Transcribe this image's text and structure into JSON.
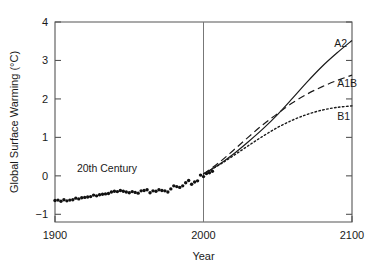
{
  "chart_data": {
    "type": "line",
    "title": "",
    "xlabel": "Year",
    "ylabel": "Global Surface Warming (°C)",
    "xlim": [
      1900,
      2100
    ],
    "ylim": [
      -1.2,
      4
    ],
    "xticks": [
      1900,
      2000,
      2100
    ],
    "xticklabels": [
      "1900",
      "2000",
      "2100"
    ],
    "yticks": [
      -1,
      0,
      1,
      2,
      3,
      4
    ],
    "yticklabels": [
      "−1",
      "0",
      "1",
      "2",
      "3",
      "4"
    ],
    "grid": false,
    "legend_position": "inline-right",
    "annotations": [
      {
        "text": "20th Century",
        "x": 1935,
        "y": 0.1
      },
      {
        "text": "A2",
        "x": 2088,
        "y": 3.35
      },
      {
        "text": "A1B",
        "x": 2090,
        "y": 2.3
      },
      {
        "text": "B1",
        "x": 2090,
        "y": 1.45
      }
    ],
    "reference_lines": [
      {
        "orientation": "vertical",
        "x": 2000,
        "style": "solid"
      }
    ],
    "series": [
      {
        "name": "20th Century",
        "style": "dots",
        "x": [
          1900,
          1902,
          1904,
          1906,
          1908,
          1910,
          1912,
          1914,
          1916,
          1918,
          1920,
          1922,
          1924,
          1926,
          1928,
          1930,
          1932,
          1934,
          1936,
          1938,
          1940,
          1942,
          1944,
          1946,
          1948,
          1950,
          1952,
          1954,
          1956,
          1958,
          1960,
          1962,
          1964,
          1966,
          1968,
          1970,
          1972,
          1974,
          1976,
          1978,
          1980,
          1982,
          1984,
          1986,
          1988,
          1990,
          1992,
          1994,
          1996,
          1998,
          2000,
          2002,
          2004,
          2006
        ],
        "values": [
          -0.64,
          -0.63,
          -0.66,
          -0.62,
          -0.65,
          -0.63,
          -0.62,
          -0.58,
          -0.6,
          -0.57,
          -0.56,
          -0.55,
          -0.54,
          -0.5,
          -0.52,
          -0.49,
          -0.48,
          -0.47,
          -0.46,
          -0.42,
          -0.4,
          -0.41,
          -0.38,
          -0.4,
          -0.42,
          -0.44,
          -0.41,
          -0.43,
          -0.45,
          -0.39,
          -0.38,
          -0.36,
          -0.44,
          -0.39,
          -0.4,
          -0.36,
          -0.38,
          -0.39,
          -0.42,
          -0.34,
          -0.26,
          -0.28,
          -0.3,
          -0.26,
          -0.18,
          -0.12,
          -0.22,
          -0.16,
          -0.13,
          0.02,
          -0.02,
          0.06,
          0.08,
          0.12
        ]
      },
      {
        "name": "A2",
        "style": "solid",
        "x": [
          2000,
          2010,
          2020,
          2030,
          2040,
          2050,
          2060,
          2070,
          2080,
          2090,
          2100
        ],
        "values": [
          0.05,
          0.28,
          0.56,
          0.88,
          1.22,
          1.6,
          2.02,
          2.45,
          2.85,
          3.2,
          3.52
        ]
      },
      {
        "name": "A1B",
        "style": "dashed",
        "x": [
          2000,
          2010,
          2020,
          2030,
          2040,
          2050,
          2060,
          2070,
          2080,
          2090,
          2100
        ],
        "values": [
          0.05,
          0.33,
          0.66,
          1.0,
          1.33,
          1.62,
          1.9,
          2.13,
          2.32,
          2.48,
          2.62
        ]
      },
      {
        "name": "B1",
        "style": "dotted",
        "x": [
          2000,
          2010,
          2020,
          2030,
          2040,
          2050,
          2060,
          2070,
          2080,
          2090,
          2100
        ],
        "values": [
          0.05,
          0.27,
          0.52,
          0.78,
          1.03,
          1.26,
          1.45,
          1.6,
          1.71,
          1.78,
          1.82
        ]
      }
    ]
  }
}
